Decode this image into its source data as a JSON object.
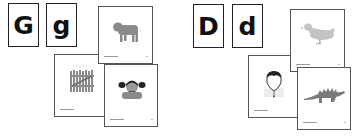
{
  "groups": [
    {
      "letter": "G",
      "uppercase": "G",
      "lowercase": "g",
      "cards": [
        {
          "subject": "sheep-icon",
          "label": "goat"
        },
        {
          "subject": "fence-icon",
          "label": "gate"
        },
        {
          "subject": "girl-icon",
          "label": "girl"
        }
      ]
    },
    {
      "letter": "D",
      "uppercase": "D",
      "lowercase": "d",
      "cards": [
        {
          "subject": "duck-icon",
          "label": "duck"
        },
        {
          "subject": "vampire-icon",
          "label": "dracula"
        },
        {
          "subject": "dinosaur-icon",
          "label": "dinosaur"
        }
      ]
    }
  ],
  "colors": {
    "illustration_gray": "#8a8a8a",
    "light_gray": "#c4c4c4",
    "border": "#222222"
  }
}
